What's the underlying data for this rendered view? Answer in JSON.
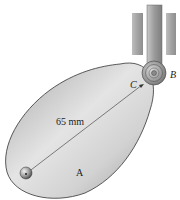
{
  "diagram": {
    "type": "cam-follower mechanism",
    "labels": {
      "dimension": "65 mm",
      "pivot": "A",
      "contact_point": "C",
      "follower": "B"
    },
    "colors": {
      "cam_fill_light": "#e6e6e6",
      "cam_fill_dark": "#a9a9a9",
      "outline": "#333333",
      "guide": "#a6a6a6",
      "rod": "#9a9a9a",
      "background": "#ffffff"
    }
  }
}
